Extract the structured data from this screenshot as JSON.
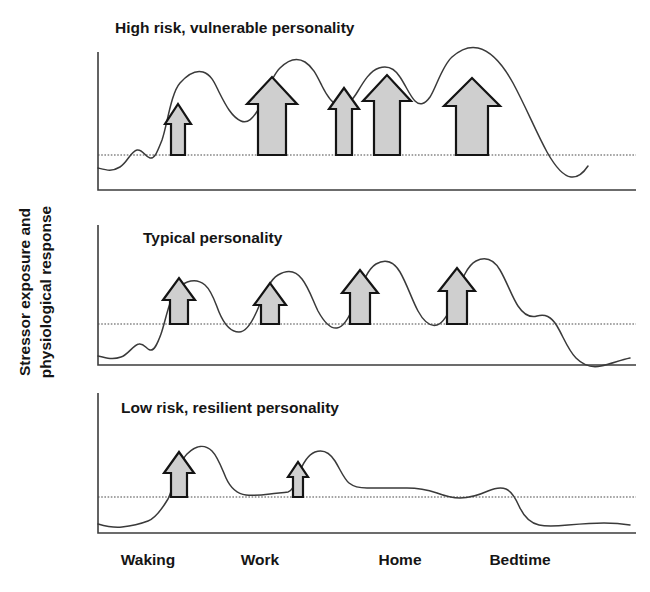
{
  "figure": {
    "y_axis_label_line1": "Stressor exposure and",
    "y_axis_label_line2": "physiological response",
    "arrow_fill_color": "#cfcfcf",
    "arrow_stroke_color": "#141414",
    "curve_color": "#3a3a3a",
    "axis_color": "#3d3d3d"
  },
  "x_axis": {
    "ticks": [
      {
        "label": "Waking",
        "x": 148
      },
      {
        "label": "Work",
        "x": 260
      },
      {
        "label": "Home",
        "x": 400
      },
      {
        "label": "Bedtime",
        "x": 520
      }
    ]
  },
  "panels": [
    {
      "id": "high-risk",
      "title": "High risk, vulnerable personality",
      "title_x": 115,
      "title_y": 33,
      "plot": {
        "left": 98,
        "top": 52,
        "right": 636,
        "bottom": 190
      },
      "threshold_y": 155,
      "arrows": [
        {
          "cx": 178,
          "half_width": 7,
          "head_half_width": 13,
          "top_y": 104,
          "head_height": 20
        },
        {
          "cx": 272,
          "half_width": 14,
          "head_half_width": 25,
          "top_y": 77,
          "head_height": 27
        },
        {
          "cx": 344,
          "half_width": 8,
          "head_half_width": 15,
          "top_y": 88,
          "head_height": 21
        },
        {
          "cx": 387,
          "half_width": 13,
          "head_half_width": 24,
          "top_y": 75,
          "head_height": 26
        },
        {
          "cx": 472,
          "half_width": 16,
          "head_half_width": 28,
          "top_y": 78,
          "head_height": 28
        }
      ],
      "curve": "M98,168 C106,170 112,172 120,167 C127,163 131,151 137,150 C143,149 145,157 150,158 C155,159 158,150 162,140 C167,126 171,93 180,83 C188,74 196,70 203,72 C212,75 215,84 219,92 C226,106 232,117 241,121 C248,124 253,118 258,110 C264,100 270,78 280,68 C289,59 297,57 305,62 C313,67 317,76 322,86 C327,96 332,104 339,106 C346,108 352,101 358,91 C364,81 370,71 379,68 C388,65 395,69 400,77 C406,86 410,96 415,101 C420,106 425,104 430,97 C436,88 442,66 452,57 C461,49 469,46 478,48 C491,51 502,63 513,83 C526,107 536,132 547,152 C556,168 563,176 571,177 C579,178 584,172 588,166",
      "title_font_size": 15.5
    },
    {
      "id": "typical",
      "title": "Typical personality",
      "title_x": 143,
      "title_y": 243,
      "plot": {
        "left": 98,
        "top": 225,
        "right": 636,
        "bottom": 365
      },
      "threshold_y": 324,
      "arrows": [
        {
          "cx": 179,
          "half_width": 9,
          "head_half_width": 16,
          "top_y": 278,
          "head_height": 22
        },
        {
          "cx": 270,
          "half_width": 9,
          "head_half_width": 16,
          "top_y": 283,
          "head_height": 22
        },
        {
          "cx": 360,
          "half_width": 10,
          "head_half_width": 18,
          "top_y": 270,
          "head_height": 23
        },
        {
          "cx": 457,
          "half_width": 10,
          "head_half_width": 18,
          "top_y": 268,
          "head_height": 23
        }
      ],
      "curve": "M98,356 C106,358 113,360 121,357 C128,355 133,345 139,344 C144,343 146,349 150,350 C154,351 157,345 161,334 C166,320 170,293 180,286 C190,279 198,279 205,285 C212,291 215,302 219,312 C224,324 231,332 239,332 C246,332 251,324 256,313 C262,300 268,281 278,275 C288,269 296,271 302,279 C309,288 313,301 318,311 C324,322 330,329 337,328 C344,327 349,318 354,305 C360,290 366,270 376,264 C386,258 394,262 400,272 C407,284 412,300 418,311 C424,322 430,327 437,325 C444,323 449,313 454,300 C460,285 466,266 476,261 C486,256 494,260 500,270 C507,282 512,297 518,306 C524,315 530,318 537,316 C545,314 551,316 557,326 C563,336 568,350 576,358 C584,366 592,368 601,366 C611,364 620,360 630,358",
      "title_font_size": 15.5
    },
    {
      "id": "low-risk",
      "title": "Low risk, resilient personality",
      "title_x": 121,
      "title_y": 413,
      "plot": {
        "left": 98,
        "top": 393,
        "right": 636,
        "bottom": 533
      },
      "threshold_y": 497,
      "arrows": [
        {
          "cx": 179,
          "half_width": 8,
          "head_half_width": 15,
          "top_y": 452,
          "head_height": 21
        },
        {
          "cx": 298,
          "half_width": 5,
          "head_half_width": 10,
          "top_y": 462,
          "head_height": 15
        }
      ],
      "curve": "M98,524 C105,526 113,528 122,527 C131,526 140,524 148,521 C156,518 162,509 168,499 C173,490 177,464 187,454 C196,445 205,444 212,451 C218,457 222,469 226,478 C231,489 238,494 246,495 C254,496 262,495 270,494 C277,493 283,493 288,492 C292,491 295,485 298,476 C302,465 307,455 315,452 C323,449 330,453 335,461 C340,469 344,479 349,483 C354,487 360,488 367,488 C380,488 394,488 407,488 C418,488 428,490 437,493 C445,496 452,498 460,498 C470,498 479,495 488,491 C495,488 501,487 506,489 C511,491 515,497 519,506 C524,517 530,523 539,525 C548,527 558,526 568,525 C580,524 592,523 604,523 C616,523 624,524 630,525",
      "title_font_size": 15.5
    }
  ]
}
